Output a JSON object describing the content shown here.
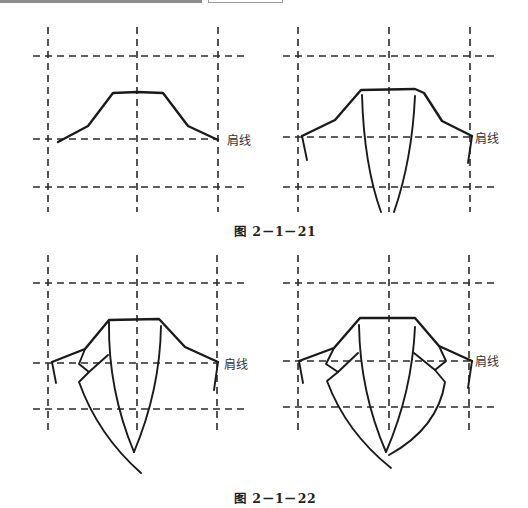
{
  "header": {
    "bar_color": "#8c8c8c"
  },
  "figures": [
    {
      "caption": "图 2－1－21",
      "panels": [
        {
          "id": "panel-1",
          "shoulder_label": "肩线"
        },
        {
          "id": "panel-2",
          "shoulder_label": "肩线"
        }
      ]
    },
    {
      "caption": "图 2－1－22",
      "panels": [
        {
          "id": "panel-3",
          "shoulder_label": "肩线"
        },
        {
          "id": "panel-4",
          "shoulder_label": "肩线"
        }
      ]
    }
  ]
}
